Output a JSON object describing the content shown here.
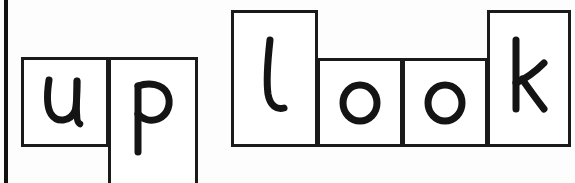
{
  "page": {
    "background_color": "#fdfdfd",
    "ink_color": "#141414",
    "tile_border_color": "#1a1a1a",
    "width": 575,
    "height": 183
  },
  "margin_rule": {
    "name": "left-margin-rule",
    "color": "#111111",
    "x": 4,
    "y": 0,
    "width": 4,
    "height": 183
  },
  "words": [
    {
      "text": "up",
      "tiles": [
        {
          "letter": "u",
          "kind": "short",
          "x": 21,
          "y": 57,
          "width": 88,
          "height": 90
        },
        {
          "letter": "p",
          "kind": "descender",
          "x": 108,
          "y": 57,
          "width": 90,
          "height": 130
        }
      ]
    },
    {
      "text": "look",
      "tiles": [
        {
          "letter": "l",
          "kind": "ascender",
          "x": 231,
          "y": 10,
          "width": 87,
          "height": 137
        },
        {
          "letter": "o",
          "kind": "short",
          "x": 317,
          "y": 58,
          "width": 86,
          "height": 89
        },
        {
          "letter": "o",
          "kind": "short",
          "x": 402,
          "y": 58,
          "width": 86,
          "height": 89
        },
        {
          "letter": "k",
          "kind": "ascender",
          "x": 487,
          "y": 10,
          "width": 84,
          "height": 137
        }
      ]
    }
  ]
}
